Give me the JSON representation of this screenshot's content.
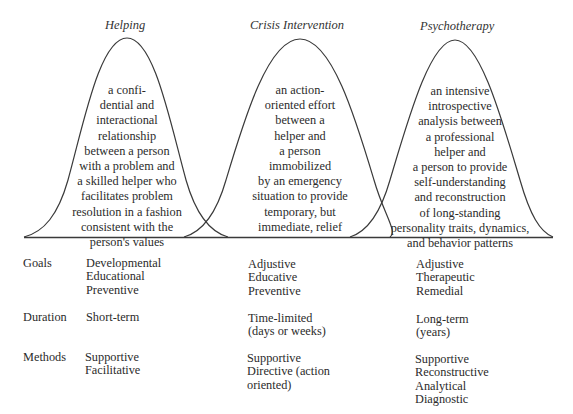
{
  "diagram": {
    "type": "overlapping bell curves with comparison table",
    "curves": [
      {
        "title": "Helping",
        "description": "a confi-\ndential and\ninteractional\nrelationship\nbetween a person\nwith a problem and\na skilled helper who\nfacilitates problem\nresolution in a fashion\nconsistent with the\nperson's values"
      },
      {
        "title": "Crisis Intervention",
        "description": "an action-\noriented effort\nbetween a\nhelper and\na person\nimmobilized\nby an emergency\nsituation to provide\ntemporary, but\nimmediate, relief"
      },
      {
        "title": "Psychotherapy",
        "description": "an intensive\nintrospective\nanalysis between\na professional\nhelper and\na person to provide\nself-understanding\nand reconstruction\nof long-standing\npersonality traits, dynamics,\nand behavior patterns"
      }
    ],
    "colors": {
      "line": "#3a3a3a",
      "text": "#2b2b2b"
    }
  },
  "table": {
    "rows": [
      {
        "label": "Goals",
        "helping": "Developmental\nEducational\nPreventive",
        "crisis": "Adjustive\nEducative\nPreventive",
        "psychotherapy": "Adjustive\nTherapeutic\nRemedial"
      },
      {
        "label": "Duration",
        "helping": "Short-term",
        "crisis": "Time-limited\n(days or weeks)",
        "psychotherapy": "Long-term\n(years)"
      },
      {
        "label": "Methods",
        "helping": "Supportive\nFacilitative",
        "crisis": "Supportive\nDirective (action\n   oriented)",
        "psychotherapy": "Supportive\nReconstructive\nAnalytical\nDiagnostic"
      }
    ]
  }
}
